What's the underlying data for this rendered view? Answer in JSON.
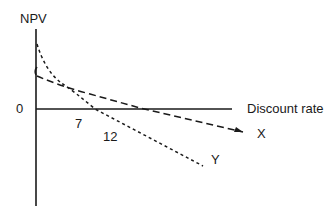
{
  "diagram": {
    "type": "npv-profile",
    "y_axis_label": "NPV",
    "x_axis_label": "Discount rate",
    "origin_label": "0",
    "tick_labels": [
      "7",
      "12"
    ],
    "series": [
      {
        "name": "X",
        "style": "long-dash",
        "irr_label": "12",
        "description": "shallower NPV profile, lower NPV at 0% rate, crosses axis further right"
      },
      {
        "name": "Y",
        "style": "short-dash",
        "irr_label": "7",
        "description": "steeper convex NPV profile, higher NPV at 0% rate, crosses axis earlier"
      }
    ],
    "colors": {
      "line": "#1a1a1a",
      "background": "#ffffff"
    }
  }
}
